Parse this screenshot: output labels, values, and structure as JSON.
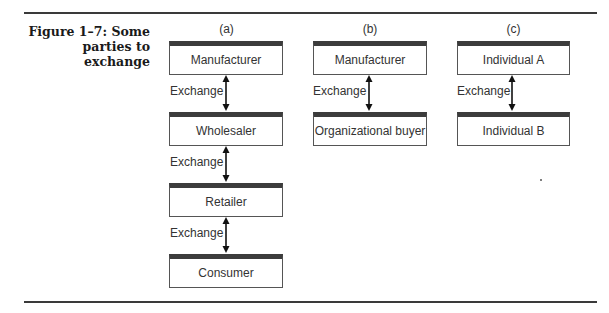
{
  "figure": {
    "caption": "Figure 1–7: Some parties to exchange",
    "caption_lines": [
      "Figure 1–7: Some",
      "parties to exchange"
    ]
  },
  "columns": [
    {
      "label": "(a)",
      "boxes": [
        "Manufacturer",
        "Wholesaler",
        "Retailer",
        "Consumer"
      ],
      "exchange_labels": [
        "Exchange",
        "Exchange",
        "Exchange"
      ]
    },
    {
      "label": "(b)",
      "boxes": [
        "Manufacturer",
        "Organizational buyer"
      ],
      "exchange_labels": [
        "Exchange"
      ]
    },
    {
      "label": "(c)",
      "boxes": [
        "Individual A",
        "Individual B"
      ],
      "exchange_labels": [
        "Exchange"
      ]
    }
  ],
  "colors": {
    "rule": "#3a3a3a",
    "box_top_bar": "#3c3c3c",
    "box_border": "#555555",
    "text": "#333333"
  }
}
